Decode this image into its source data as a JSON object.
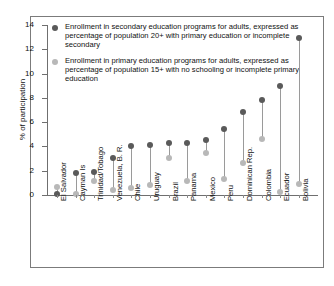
{
  "chart_data": {
    "type": "scatter",
    "title": "",
    "xlabel": "",
    "ylabel": "% of participation",
    "ylim": [
      0,
      14
    ],
    "yticks": [
      0,
      2,
      4,
      6,
      8,
      10,
      12,
      14
    ],
    "grid": false,
    "legend_position": "top-left inside plot",
    "categories": [
      "El Salvador",
      "Cayman Is",
      "Trinidad/Tobago",
      "Venezuela, B. R.",
      "Chile",
      "Uruguay",
      "Brazil",
      "Panama",
      "Mexico",
      "Peru",
      "Dominican Rep.",
      "Colombia",
      "Ecuador",
      "Bolivia"
    ],
    "series": [
      {
        "name": "Enrollment in secondary education programs for adults, expressed as percentage of population 20+ with primary education or incomplete secondary",
        "color": "#5a5a5a",
        "values": [
          0.05,
          1.85,
          1.9,
          3.05,
          4.05,
          4.1,
          4.25,
          4.25,
          4.5,
          5.4,
          6.85,
          7.85,
          9.0,
          12.95
        ]
      },
      {
        "name": "Enrollment in primary education programs for adults, expressed as percentage of population 15+ with no schooling or incomplete primary education",
        "color": "#b8b8b8",
        "values": [
          0.65,
          0.1,
          1.15,
          0.45,
          0.55,
          0.85,
          3.05,
          1.15,
          3.45,
          1.35,
          2.6,
          4.6,
          0.25,
          0.9
        ]
      }
    ]
  },
  "axis": {
    "y_title": "% of participation",
    "y_tick_labels": [
      "0",
      "2",
      "4",
      "6",
      "8",
      "10",
      "12",
      "14"
    ]
  },
  "legend": {
    "entries": [
      {
        "marker": "dark-circle-marker",
        "label": "Enrollment in secondary education programs for adults, expressed as percentage of population 20+ with primary education or incomplete secondary",
        "color": "#5a5a5a"
      },
      {
        "marker": "light-circle-marker",
        "label": "Enrollment in primary education programs for adults, expressed as percentage of population 15+ with no schooling or incomplete primary education",
        "color": "#b8b8b8"
      }
    ]
  }
}
